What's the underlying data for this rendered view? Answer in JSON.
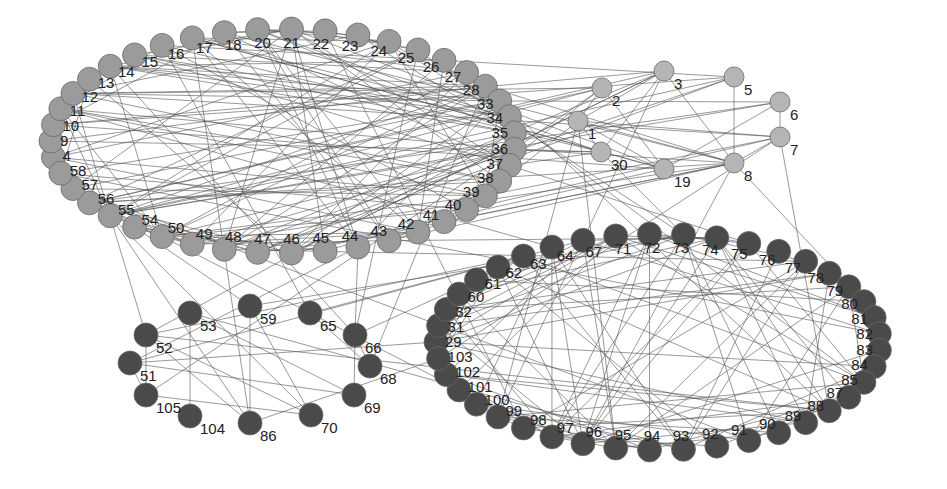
{
  "diagram": {
    "type": "network-graph",
    "colors": {
      "background": "#ffffff",
      "edge": "#555555",
      "light_node": "#b5b5b5",
      "medium_node": "#9b9b9b",
      "dark_node": "#4a4a4a",
      "label": "#222222"
    },
    "clusters": [
      {
        "id": "cluster-a",
        "shade": "medium",
        "layout": "ellipse",
        "center": [
          283,
          141
        ],
        "rx": 232,
        "ry": 112,
        "nodes": [
          "9",
          "10",
          "11",
          "12",
          "13",
          "14",
          "15",
          "16",
          "17",
          "18",
          "20",
          "21",
          "22",
          "23",
          "24",
          "25",
          "26",
          "27",
          "28",
          "33",
          "34",
          "35",
          "36",
          "37",
          "38",
          "39",
          "40",
          "41",
          "42",
          "43",
          "44",
          "45",
          "46",
          "47",
          "48",
          "49",
          "50",
          "54",
          "55",
          "56",
          "57",
          "58",
          "4"
        ]
      },
      {
        "id": "cluster-b",
        "shade": "light",
        "layout": "free",
        "nodes": [
          {
            "id": "1",
            "x": 578,
            "y": 121
          },
          {
            "id": "2",
            "x": 602,
            "y": 88
          },
          {
            "id": "3",
            "x": 664,
            "y": 71
          },
          {
            "id": "5",
            "x": 734,
            "y": 77
          },
          {
            "id": "6",
            "x": 780,
            "y": 102
          },
          {
            "id": "7",
            "x": 780,
            "y": 137
          },
          {
            "id": "8",
            "x": 734,
            "y": 163
          },
          {
            "id": "19",
            "x": 664,
            "y": 169
          },
          {
            "id": "30",
            "x": 601,
            "y": 152
          }
        ]
      },
      {
        "id": "cluster-c",
        "shade": "dark",
        "layout": "free",
        "nodes": [
          {
            "id": "51",
            "x": 130,
            "y": 363
          },
          {
            "id": "52",
            "x": 146,
            "y": 335
          },
          {
            "id": "53",
            "x": 190,
            "y": 313
          },
          {
            "id": "59",
            "x": 250,
            "y": 306
          },
          {
            "id": "65",
            "x": 310,
            "y": 313
          },
          {
            "id": "66",
            "x": 355,
            "y": 335
          },
          {
            "id": "68",
            "x": 370,
            "y": 366
          },
          {
            "id": "69",
            "x": 354,
            "y": 395
          },
          {
            "id": "70",
            "x": 311,
            "y": 415
          },
          {
            "id": "86",
            "x": 250,
            "y": 423
          },
          {
            "id": "104",
            "x": 190,
            "y": 416
          },
          {
            "id": "105",
            "x": 146,
            "y": 395
          }
        ]
      },
      {
        "id": "cluster-d",
        "shade": "dark",
        "layout": "ellipse",
        "center": [
          658,
          342
        ],
        "rx": 222,
        "ry": 108,
        "nodes": [
          "29",
          "31",
          "32",
          "60",
          "61",
          "62",
          "63",
          "64",
          "67",
          "71",
          "72",
          "73",
          "74",
          "75",
          "76",
          "77",
          "78",
          "79",
          "80",
          "81",
          "82",
          "83",
          "84",
          "85",
          "87",
          "88",
          "89",
          "90",
          "91",
          "92",
          "93",
          "94",
          "95",
          "96",
          "97",
          "98",
          "99",
          "100",
          "101",
          "102",
          "103"
        ]
      }
    ]
  }
}
